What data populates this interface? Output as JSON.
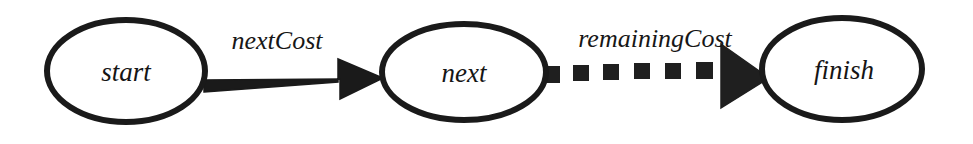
{
  "diagram": {
    "background_color": "#ffffff",
    "stroke_color": "#1a1a1a",
    "nodes": [
      {
        "id": "start",
        "label": "start",
        "shape": "ellipse",
        "cx": 126,
        "cy": 71,
        "rx": 79,
        "ry": 51,
        "stroke_width": 6
      },
      {
        "id": "next",
        "label": "next",
        "shape": "ellipse",
        "cx": 464,
        "cy": 72,
        "rx": 82,
        "ry": 48,
        "stroke_width": 6
      },
      {
        "id": "finish",
        "label": "finish",
        "shape": "ellipse",
        "cx": 842,
        "cy": 69,
        "rx": 80,
        "ry": 51,
        "stroke_width": 6
      }
    ],
    "edges": [
      {
        "id": "start-to-next",
        "label": "nextCost",
        "from": "start",
        "to": "next",
        "style": "solid",
        "label_x": 277,
        "label_y": 49,
        "x1": 204,
        "y1": 86,
        "x2": 383,
        "y2": 78,
        "shaft_width": 13,
        "arrowhead": "filled-triangle"
      },
      {
        "id": "next-to-finish",
        "label": "remainingCost",
        "from": "next",
        "to": "finish",
        "style": "dashed",
        "label_x": 655,
        "label_y": 47,
        "x1": 543,
        "y1": 80,
        "x2": 768,
        "y2": 78,
        "dash_count": 6,
        "dash_length": 16,
        "dash_gap": 15,
        "shaft_width": 15,
        "arrowhead": "filled-triangle"
      }
    ]
  }
}
